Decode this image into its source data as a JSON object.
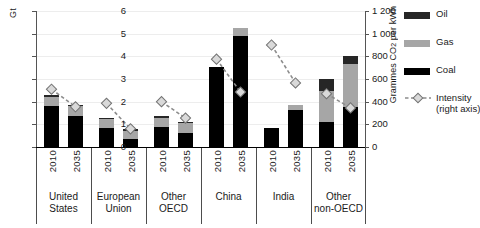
{
  "chart_data": {
    "type": "bar",
    "title": "",
    "ylabel": "Gt",
    "ylabel_right": "Grammes CO2 per kWh",
    "xlabel": "",
    "ylim": [
      0,
      6
    ],
    "ylim_right": [
      0,
      1200
    ],
    "yticks": [
      "0",
      "1",
      "2",
      "3",
      "4",
      "5",
      "6"
    ],
    "yticks_right": [
      "0",
      "200",
      "400",
      "600",
      "800",
      "1 000",
      "1 200"
    ],
    "grid": true,
    "legend_position": "right",
    "stacked": true,
    "categories": [
      "United States 2010",
      "United States 2035",
      "European Union 2010",
      "European Union 2035",
      "Other OECD 2010",
      "Other OECD 2035",
      "China 2010",
      "China 2035",
      "India 2010",
      "India 2035",
      "Other non-OECD 2010",
      "Other non-OECD 2035"
    ],
    "groups": [
      {
        "name": "United States",
        "name_lines": [
          "United",
          "States"
        ],
        "bars": [
          {
            "year": "2010",
            "coal": 1.8,
            "gas": 0.4,
            "oil": 0.1,
            "total": 2.3,
            "intensity": 510
          },
          {
            "year": "2035",
            "coal": 1.35,
            "gas": 0.45,
            "oil": 0.05,
            "total": 1.85,
            "intensity": 355
          }
        ]
      },
      {
        "name": "European Union",
        "name_lines": [
          "European",
          "Union"
        ],
        "bars": [
          {
            "year": "2010",
            "coal": 0.85,
            "gas": 0.4,
            "oil": 0.05,
            "total": 1.3,
            "intensity": 385
          },
          {
            "year": "2035",
            "coal": 0.35,
            "gas": 0.37,
            "oil": 0.06,
            "total": 0.78,
            "intensity": 160
          }
        ]
      },
      {
        "name": "Other OECD",
        "name_lines": [
          "Other",
          "OECD"
        ],
        "bars": [
          {
            "year": "2010",
            "coal": 0.9,
            "gas": 0.38,
            "oil": 0.07,
            "total": 1.35,
            "intensity": 400
          },
          {
            "year": "2035",
            "coal": 0.62,
            "gas": 0.43,
            "oil": 0.07,
            "total": 1.12,
            "intensity": 255
          }
        ]
      },
      {
        "name": "China",
        "name_lines": [
          "China"
        ],
        "bars": [
          {
            "year": "2010",
            "coal": 3.55,
            "gas": 0.0,
            "oil": 0.0,
            "total": 3.55,
            "intensity": 775
          },
          {
            "year": "2035",
            "coal": 4.9,
            "gas": 0.35,
            "oil": 0.0,
            "total": 5.25,
            "intensity": 485
          }
        ]
      },
      {
        "name": "India",
        "name_lines": [
          "India"
        ],
        "bars": [
          {
            "year": "2010",
            "coal": 0.85,
            "gas": 0.0,
            "oil": 0.0,
            "total": 0.85,
            "intensity": 900
          },
          {
            "year": "2035",
            "coal": 1.65,
            "gas": 0.2,
            "oil": 0.0,
            "total": 1.85,
            "intensity": 565
          }
        ]
      },
      {
        "name": "Other non-OECD",
        "name_lines": [
          "Other",
          "non-OECD"
        ],
        "bars": [
          {
            "year": "2010",
            "coal": 1.1,
            "gas": 1.35,
            "oil": 0.57,
            "total": 3.02,
            "intensity": 470
          },
          {
            "year": "2035",
            "coal": 1.75,
            "gas": 1.9,
            "oil": 0.35,
            "total": 4.0,
            "intensity": 345
          }
        ]
      }
    ],
    "series": [
      {
        "name": "Coal",
        "key": "coal",
        "color": "#000000",
        "values": [
          1.8,
          1.35,
          0.85,
          0.35,
          0.9,
          0.62,
          3.55,
          4.9,
          0.85,
          1.65,
          1.1,
          1.75
        ]
      },
      {
        "name": "Gas",
        "key": "gas",
        "color": "#a6a6a6",
        "values": [
          0.4,
          0.45,
          0.4,
          0.37,
          0.38,
          0.43,
          0.0,
          0.35,
          0.0,
          0.2,
          1.35,
          1.9
        ]
      },
      {
        "name": "Oil",
        "key": "oil",
        "color": "#262626",
        "values": [
          0.1,
          0.05,
          0.05,
          0.06,
          0.07,
          0.07,
          0.0,
          0.0,
          0.0,
          0.0,
          0.57,
          0.35
        ]
      },
      {
        "name": "Intensity (right axis)",
        "key": "intensity",
        "color": "#8c8c8c",
        "axis": "right",
        "values": [
          510,
          355,
          385,
          160,
          400,
          255,
          775,
          485,
          900,
          565,
          470,
          345
        ]
      }
    ]
  },
  "legend": {
    "items": [
      {
        "label": "Oil",
        "color": "#262626",
        "marker": "swatch"
      },
      {
        "label": "Gas",
        "color": "#a6a6a6",
        "marker": "swatch"
      },
      {
        "label": "Coal",
        "color": "#000000",
        "marker": "swatch"
      },
      {
        "label": "Intensity",
        "label2": "(right axis)",
        "color": "#8c8c8c",
        "marker": "dashed-diamond"
      }
    ]
  }
}
